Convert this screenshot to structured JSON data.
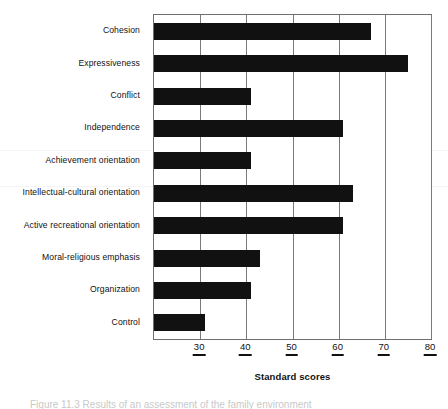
{
  "chart_data": {
    "type": "bar",
    "orientation": "horizontal",
    "title": "",
    "xlabel": "Standard scores",
    "ylabel": "",
    "xlim": [
      20,
      80
    ],
    "xticks": [
      30,
      40,
      50,
      60,
      70,
      80
    ],
    "xtick_labels": [
      "30",
      "40",
      "50",
      "60",
      "70",
      "80"
    ],
    "grid": "vertical",
    "legend": "none",
    "bar_color": "#111111",
    "categories": [
      "Cohesion",
      "Expressiveness",
      "Conflict",
      "Independence",
      "Achievement orientation",
      "Intellectual-cultural orientation",
      "Active recreational orientation",
      "Moral-religious emphasis",
      "Organization",
      "Control"
    ],
    "values": [
      67,
      75,
      41,
      61,
      41,
      63,
      61,
      43,
      41,
      31
    ]
  },
  "axis": {
    "x_title": "Standard scores"
  },
  "caption": {
    "sliver_text": "Figure 11.3   Results of an assessment of the family environment"
  }
}
